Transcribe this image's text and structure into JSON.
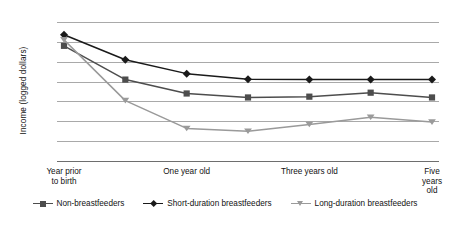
{
  "chart_data": {
    "type": "line",
    "title": "",
    "xlabel": "",
    "ylabel": "Income (logged dollars)",
    "ylim": [
      6.5,
      10.0
    ],
    "ytick_step": 0.5,
    "ytick_labels": [
      "10.0",
      "9.5",
      "9.0",
      "8.5",
      "8.0",
      "7.5",
      "7.0",
      "6.5"
    ],
    "ytick_values": [
      10.0,
      9.5,
      9.0,
      8.5,
      8.0,
      7.5,
      7.0,
      6.5
    ],
    "grid": true,
    "legend_position": "bottom",
    "x_points": 7,
    "x_tick_labels": [
      "Year prior\nto birth",
      "One year old",
      "Three years old",
      "Five years old"
    ],
    "x_tick_indices": [
      0,
      2,
      4,
      6
    ],
    "series": [
      {
        "name": "Non-breastfeeders",
        "marker": "square",
        "color": "#4d4d4d",
        "values": [
          9.4,
          8.55,
          8.2,
          8.1,
          8.12,
          8.22,
          8.1
        ]
      },
      {
        "name": "Short-duration breastfeeders",
        "marker": "diamond",
        "color": "#1a1a1a",
        "values": [
          9.68,
          9.05,
          8.7,
          8.56,
          8.55,
          8.55,
          8.55
        ]
      },
      {
        "name": "Long-duration breastfeeders",
        "marker": "triangle-down",
        "color": "#9a9a9a",
        "values": [
          9.55,
          8.02,
          7.32,
          7.25,
          7.42,
          7.6,
          7.48
        ]
      }
    ]
  },
  "legend": {
    "items": [
      {
        "label": "Non-breastfeeders"
      },
      {
        "label": "Short-duration breastfeeders"
      },
      {
        "label": "Long-duration breastfeeders"
      }
    ]
  },
  "colors": {
    "gridline": "#a9a9a9",
    "axis": "#6e6e6e",
    "background": "#ffffff",
    "text": "#111111"
  }
}
